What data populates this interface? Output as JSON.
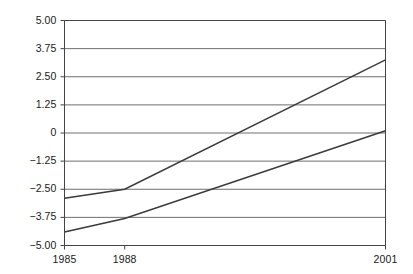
{
  "chart_data": {
    "type": "line",
    "title": "",
    "subtitle": "",
    "xlabel": "",
    "ylabel": "",
    "x": [
      1985,
      1988,
      2001
    ],
    "xtick_labels": [
      "1985",
      "1988",
      "2001"
    ],
    "ytick_labels": [
      "5.00",
      "3.75",
      "2.50",
      "1.25",
      "0",
      "−1.25",
      "−2.50",
      "−3.75",
      "−5.00"
    ],
    "ytick_values": [
      5.0,
      3.75,
      2.5,
      1.25,
      0,
      -1.25,
      -2.5,
      -3.75,
      -5.0
    ],
    "ylim": [
      -5.0,
      5.0
    ],
    "xlim": [
      1985,
      2001
    ],
    "grid": "horizontal",
    "legend": "none",
    "series": [
      {
        "name": "upper",
        "values": [
          -2.9,
          -2.5,
          3.25
        ],
        "color": "#3a3a3a"
      },
      {
        "name": "lower",
        "values": [
          -4.4,
          -3.8,
          0.1
        ],
        "color": "#3a3a3a"
      }
    ],
    "colors": {
      "axis": "#444444",
      "grid": "#6e6e6e",
      "line": "#3a3a3a",
      "background": "#ffffff",
      "text": "#1a1a1a"
    }
  }
}
